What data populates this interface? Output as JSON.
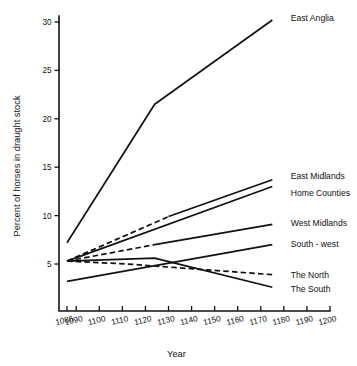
{
  "chart_data": {
    "type": "line",
    "title": "",
    "xlabel": "Year",
    "ylabel": "Percent of horses in draught stock",
    "xlim": [
      1086,
      1200
    ],
    "ylim": [
      0,
      31.5
    ],
    "grid": false,
    "legend_position": "right-inline-labels",
    "x_ticks": [
      1086,
      1090,
      1100,
      1110,
      1120,
      1130,
      1140,
      1150,
      1160,
      1170,
      1180,
      1190,
      1200
    ],
    "x_tick_labels": [
      "1086",
      "1090",
      "1100",
      "1110",
      "1120",
      "1130",
      "1140",
      "1150",
      "1160",
      "1170",
      "1180",
      "1190",
      "1200"
    ],
    "y_ticks": [
      5,
      10,
      15,
      20,
      25,
      30
    ],
    "y_tick_labels": [
      "5",
      "10",
      "15",
      "20",
      "25",
      "30"
    ],
    "series": [
      {
        "name": "East Anglia",
        "style": "solid",
        "x": [
          1086,
          1124,
          1175
        ],
        "values": [
          7.2,
          21.5,
          30.2
        ],
        "label_x": 1183,
        "label_y": 30.4
      },
      {
        "name": "East Midlands",
        "style": "dashed-then-solid",
        "dash_until": 1130,
        "x": [
          1086,
          1130,
          1175
        ],
        "values": [
          5.3,
          9.9,
          13.7
        ],
        "label_x": 1183,
        "label_y": 14.1
      },
      {
        "name": "Home Counties",
        "style": "solid",
        "x": [
          1086,
          1175
        ],
        "values": [
          5.3,
          13.0
        ],
        "label_x": 1183,
        "label_y": 12.3
      },
      {
        "name": "West Midlands",
        "style": "dashed-then-solid",
        "dash_until": 1124,
        "x": [
          1086,
          1124,
          1175
        ],
        "values": [
          5.3,
          7.0,
          9.1
        ],
        "label_x": 1183,
        "label_y": 9.2
      },
      {
        "name": "South - west",
        "style": "solid",
        "x": [
          1086,
          1175
        ],
        "values": [
          3.2,
          7.0
        ],
        "label_x": 1183,
        "label_y": 7.1
      },
      {
        "name": "The North",
        "style": "dashed",
        "x": [
          1086,
          1112,
          1175
        ],
        "values": [
          5.3,
          5.0,
          3.9
        ],
        "label_x": 1183,
        "label_y": 3.9
      },
      {
        "name": "The South",
        "style": "solid",
        "x": [
          1086,
          1124,
          1175
        ],
        "values": [
          5.3,
          5.6,
          2.6
        ],
        "label_x": 1183,
        "label_y": 2.4
      }
    ]
  }
}
